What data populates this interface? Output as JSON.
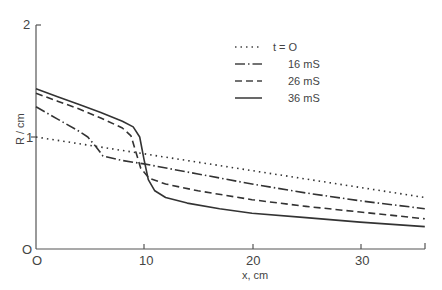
{
  "chart_data": {
    "type": "line",
    "title": "",
    "xlabel": "x, cm",
    "ylabel": "R / cm",
    "xlim": [
      0,
      36
    ],
    "ylim": [
      0,
      2
    ],
    "xticks": [
      "0",
      "10",
      "20",
      "30"
    ],
    "yticks": [
      "0",
      "1",
      "2"
    ],
    "grid": false,
    "legend_position": "upper right",
    "series": [
      {
        "name": "t = 0",
        "style": "dotted",
        "x": [
          0,
          36
        ],
        "y": [
          1.0,
          0.46
        ]
      },
      {
        "name": "16 mS",
        "style": "dash-dot",
        "x": [
          0,
          2,
          4,
          4.8,
          5.5,
          6.2,
          8,
          10,
          15,
          20,
          25,
          30,
          36
        ],
        "y": [
          1.27,
          1.16,
          1.05,
          1.0,
          0.92,
          0.83,
          0.79,
          0.76,
          0.67,
          0.58,
          0.5,
          0.43,
          0.36
        ]
      },
      {
        "name": "26 mS",
        "style": "dashed",
        "x": [
          0,
          2,
          4,
          6,
          8,
          8.8,
          9.3,
          9.7,
          10.5,
          12,
          15,
          20,
          25,
          30,
          36
        ],
        "y": [
          1.39,
          1.32,
          1.25,
          1.17,
          1.08,
          1.01,
          0.85,
          0.72,
          0.63,
          0.58,
          0.52,
          0.44,
          0.38,
          0.33,
          0.27
        ]
      },
      {
        "name": "36 mS",
        "style": "solid",
        "x": [
          0,
          2,
          4,
          6,
          8,
          9,
          9.6,
          10,
          10.4,
          11,
          12,
          14,
          17,
          20,
          25,
          30,
          36
        ],
        "y": [
          1.43,
          1.36,
          1.29,
          1.22,
          1.14,
          1.09,
          1.0,
          0.8,
          0.62,
          0.52,
          0.46,
          0.41,
          0.36,
          0.32,
          0.28,
          0.24,
          0.2
        ]
      }
    ]
  },
  "legend": {
    "items": [
      {
        "label": "t = O",
        "style": "dotted"
      },
      {
        "label": "16 mS",
        "style": "dash-dot"
      },
      {
        "label": "26 mS",
        "style": "dashed"
      },
      {
        "label": "36 mS",
        "style": "solid"
      }
    ]
  },
  "axes": {
    "xlabel": "x, cm",
    "ylabel": "R / cm",
    "xtick_labels": [
      "O",
      "10",
      "20",
      "30"
    ],
    "ytick_labels": [
      "O",
      "1",
      "2"
    ]
  }
}
